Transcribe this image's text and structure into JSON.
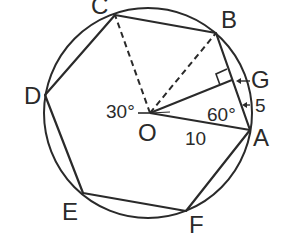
{
  "diagram": {
    "type": "geometry",
    "colors": {
      "stroke": "#2a2a2a",
      "background": "#ffffff"
    },
    "circle": {
      "center_label": "O",
      "radius_label": "10"
    },
    "vertices": [
      {
        "id": "A",
        "label": "A"
      },
      {
        "id": "B",
        "label": "B"
      },
      {
        "id": "C",
        "label": "C"
      },
      {
        "id": "D",
        "label": "D"
      },
      {
        "id": "E",
        "label": "E"
      },
      {
        "id": "F",
        "label": "F"
      }
    ],
    "foot_point": {
      "id": "G",
      "label": "G"
    },
    "annotations": {
      "angle_at_O": "30°",
      "angle_at_A": "60°",
      "segment_GA": "5",
      "segment_OA": "10"
    },
    "edges": {
      "solid": [
        "AB",
        "BC",
        "CD",
        "DE",
        "EF",
        "FA",
        "OA",
        "OG"
      ],
      "dashed": [
        "OB",
        "OC"
      ]
    },
    "right_angle_marker": "at G between OG and AB"
  }
}
